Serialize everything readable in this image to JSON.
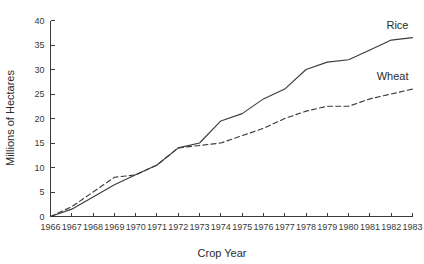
{
  "chart_data": {
    "type": "line",
    "title": "",
    "xlabel": "Crop Year",
    "ylabel": "Millions of Hectares",
    "x": [
      1966,
      1967,
      1968,
      1969,
      1970,
      1971,
      1972,
      1973,
      1974,
      1975,
      1976,
      1977,
      1978,
      1979,
      1980,
      1981,
      1982,
      1983
    ],
    "categories": [
      "1966",
      "1967",
      "1968",
      "1969",
      "1970",
      "1971",
      "1972",
      "1973",
      "1974",
      "1975",
      "1976",
      "1977",
      "1978",
      "1979",
      "1980",
      "1981",
      "1982",
      "1983"
    ],
    "xlim": [
      1966,
      1983
    ],
    "ylim": [
      0,
      40
    ],
    "yticks": [
      0,
      5,
      10,
      15,
      20,
      25,
      30,
      35,
      40
    ],
    "ytick_labels": [
      "0",
      "5",
      "10",
      "15",
      "20",
      "25",
      "30",
      "35",
      "40"
    ],
    "grid": false,
    "legend_position": "inline-right-end-of-line",
    "series": [
      {
        "name": "Rice",
        "style": "solid",
        "color": "#3c3c3c",
        "values": [
          0,
          1.5,
          4.0,
          6.5,
          8.5,
          10.5,
          14.0,
          15.0,
          19.5,
          21.0,
          24.0,
          26.0,
          30.0,
          31.5,
          32.0,
          34.0,
          36.0,
          36.5
        ]
      },
      {
        "name": "Wheat",
        "style": "dashed",
        "color": "#3c3c3c",
        "values": [
          0,
          2.0,
          5.0,
          8.0,
          8.5,
          10.5,
          14.0,
          14.5,
          15.0,
          16.5,
          18.0,
          20.0,
          21.5,
          22.5,
          22.5,
          24.0,
          25.0,
          26.0
        ]
      }
    ],
    "annotations": [
      {
        "name": "Rice",
        "text": "Rice"
      },
      {
        "name": "Wheat",
        "text": "Wheat"
      }
    ]
  },
  "axes": {
    "y_label": "Millions of Hectares",
    "x_label": "Crop Year"
  }
}
